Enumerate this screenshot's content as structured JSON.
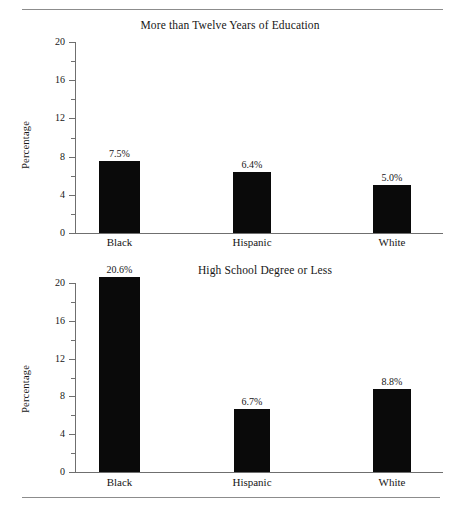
{
  "figure": {
    "rules": {
      "top": true,
      "bottom": true
    }
  },
  "charts": [
    {
      "id": "chart-top",
      "title": "More than Twelve Years of Education",
      "ylabel": "Percentage"
    },
    {
      "id": "chart-bottom",
      "title": "High School Degree or Less",
      "ylabel": "Percentage"
    }
  ],
  "axis": {
    "ticks_major": [
      "0",
      "4",
      "8",
      "12",
      "16",
      "20"
    ],
    "categories": [
      "Black",
      "Hispanic",
      "White"
    ]
  },
  "chart_data": [
    {
      "type": "bar",
      "title": "More than Twelve Years of Education",
      "xlabel": "",
      "ylabel": "Percentage",
      "categories": [
        "Black",
        "Hispanic",
        "White"
      ],
      "values": [
        7.5,
        6.4,
        5.0
      ],
      "value_labels": [
        "7.5%",
        "6.4%",
        "5.0%"
      ],
      "ylim": [
        0,
        20
      ],
      "ytick_major": [
        0,
        4,
        8,
        12,
        16,
        20
      ],
      "ytick_minor": [
        2,
        6,
        10,
        14,
        18
      ],
      "ytick_labels": [
        "0",
        "4",
        "8",
        "12",
        "16",
        "20"
      ],
      "grid": false,
      "legend": "none",
      "bar_color": "#0a0a0a"
    },
    {
      "type": "bar",
      "title": "High School Degree or Less",
      "xlabel": "",
      "ylabel": "Percentage",
      "categories": [
        "Black",
        "Hispanic",
        "White"
      ],
      "values": [
        20.6,
        6.7,
        8.8
      ],
      "value_labels": [
        "20.6%",
        "6.7%",
        "8.8%"
      ],
      "ylim": [
        0,
        20
      ],
      "ytick_major": [
        0,
        4,
        8,
        12,
        16,
        20
      ],
      "ytick_minor": [
        2,
        6,
        10,
        14,
        18
      ],
      "ytick_labels": [
        "0",
        "4",
        "8",
        "12",
        "16",
        "20"
      ],
      "grid": false,
      "legend": "none",
      "bar_color": "#0a0a0a"
    }
  ]
}
